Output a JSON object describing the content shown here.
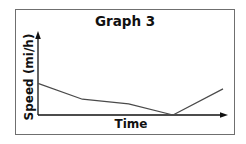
{
  "chart_data": {
    "type": "line",
    "title": "Graph 3",
    "xlabel": "Time",
    "ylabel": "Speed (mi/h)",
    "grid": false,
    "legend": null,
    "x_ticks": [],
    "y_ticks": [],
    "series": [
      {
        "name": "speed",
        "x": [
          0,
          0.24,
          0.49,
          0.73,
          1.0
        ],
        "y": [
          0.4,
          0.2,
          0.14,
          0.0,
          0.33
        ],
        "note": "unlabeled axes; values normalized to plot area (x: time fraction, y: speed fraction of axis height)"
      }
    ],
    "xlim": [
      0,
      1
    ],
    "ylim": [
      0,
      1
    ]
  },
  "colors": {
    "line": "#4a4a4a",
    "axes": "#111111",
    "frame": "#6f6f6f",
    "text": "#111111"
  }
}
